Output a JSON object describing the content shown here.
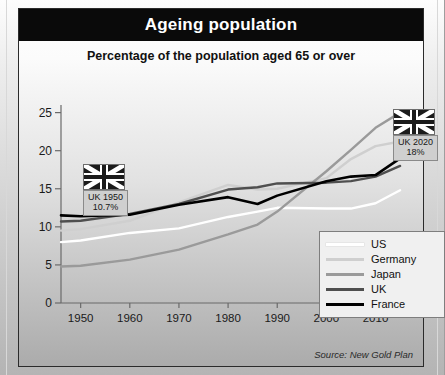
{
  "header": {
    "title": "Ageing population",
    "subtitle": "Percentage of the population aged 65 or over"
  },
  "source": "Source: New Gold Plan",
  "colors": {
    "us": "#ffffff",
    "germany": "#cfcfcf",
    "japan": "#9a9a9a",
    "uk": "#4f4f4f",
    "france": "#000000",
    "title_bar": "#0a0a0a",
    "axis": "#6a6a6a"
  },
  "legend": {
    "position": "bottom-right",
    "items": [
      {
        "label": "US",
        "color": "#ffffff"
      },
      {
        "label": "Germany",
        "color": "#cfcfcf"
      },
      {
        "label": "Japan",
        "color": "#9a9a9a"
      },
      {
        "label": "UK",
        "color": "#4f4f4f"
      },
      {
        "label": "France",
        "color": "#000000"
      }
    ]
  },
  "callouts": [
    {
      "name": "uk-1950",
      "flag": "union-jack-flag",
      "title": "UK 1950",
      "value": "10.7%"
    },
    {
      "name": "uk-2020",
      "flag": "union-jack-flag",
      "title": "UK 2020",
      "value": "18%"
    }
  ],
  "chart_data": {
    "type": "line",
    "title": "Ageing population",
    "subtitle": "Percentage of the population aged 65 or over",
    "xlabel": "",
    "ylabel": "",
    "xlim": [
      1946,
      2016
    ],
    "ylim": [
      0,
      26
    ],
    "xticks": [
      1950,
      1960,
      1970,
      1980,
      1990,
      2000,
      2010,
      2020
    ],
    "yticks": [
      0,
      5,
      10,
      15,
      20,
      25
    ],
    "grid": false,
    "x": [
      1946,
      1950,
      1960,
      1970,
      1980,
      1986,
      1990,
      2000,
      2005,
      2010,
      2015
    ],
    "series": [
      {
        "name": "US",
        "color": "#ffffff",
        "values": [
          8.0,
          8.2,
          9.2,
          9.8,
          11.3,
          12.0,
          12.5,
          12.4,
          12.4,
          13.1,
          14.8
        ]
      },
      {
        "name": "Germany",
        "color": "#cfcfcf",
        "values": [
          9.5,
          9.7,
          10.8,
          13.2,
          15.5,
          14.9,
          15.0,
          16.4,
          18.9,
          20.6,
          21.2
        ]
      },
      {
        "name": "Japan",
        "color": "#9a9a9a",
        "values": [
          4.8,
          4.9,
          5.7,
          7.0,
          9.0,
          10.3,
          12.0,
          17.3,
          20.1,
          23.0,
          25.0
        ]
      },
      {
        "name": "UK",
        "color": "#4f4f4f",
        "values": [
          10.7,
          10.8,
          11.7,
          13.0,
          14.9,
          15.2,
          15.7,
          15.8,
          16.0,
          16.6,
          18.0
        ]
      },
      {
        "name": "France",
        "color": "#000000",
        "values": [
          11.5,
          11.4,
          11.6,
          12.9,
          13.9,
          13.0,
          14.1,
          16.0,
          16.6,
          16.8,
          19.0
        ]
      }
    ],
    "annotations": [
      {
        "text": "UK 1950 10.7%",
        "x": 1950,
        "y": 10.7
      },
      {
        "text": "UK 2020 18%",
        "x": 2015,
        "y": 18.0
      }
    ]
  }
}
